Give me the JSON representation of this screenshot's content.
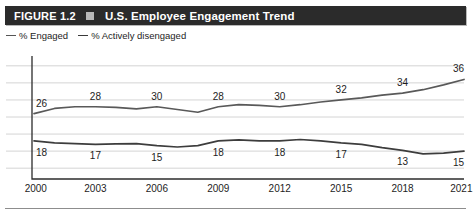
{
  "figure": {
    "number_label": "FIGURE 1.2",
    "bullet_icon": "square-bullet-icon",
    "title": "U.S. Employee Engagement Trend",
    "bar_color": "#2b2b2b",
    "bullet_color": "#b9b9b9"
  },
  "legend": {
    "position": "top-left",
    "items": [
      {
        "label": "% Engaged",
        "color": "#555555",
        "marker": "dash"
      },
      {
        "label": "% Actively disengaged",
        "color": "#3a3a3a",
        "marker": "dash"
      }
    ]
  },
  "source": {
    "text": ""
  },
  "chart_data": {
    "type": "line",
    "title": "U.S. Employee Engagement Trend",
    "xlabel": "",
    "ylabel": "",
    "grid": true,
    "gridlines_y": [
      10,
      15,
      20,
      25,
      30,
      35,
      40
    ],
    "ylim": [
      8,
      42
    ],
    "xlim": [
      2000,
      2021
    ],
    "tick_labels": [
      "2000",
      "2003",
      "2006",
      "2009",
      "2012",
      "2015",
      "2018",
      "2021"
    ],
    "ticks_x": [
      2000,
      2003,
      2006,
      2009,
      2012,
      2015,
      2018,
      2021
    ],
    "legend_position": "above-plot-left",
    "series": [
      {
        "name": "% Engaged",
        "color": "#595959",
        "x": [
          2000,
          2001,
          2002,
          2003,
          2004,
          2005,
          2006,
          2007,
          2008,
          2009,
          2010,
          2011,
          2012,
          2013,
          2014,
          2015,
          2016,
          2017,
          2018,
          2019,
          2020,
          2021
        ],
        "values": [
          26,
          27.5,
          28,
          28,
          27.8,
          27.4,
          28,
          27.2,
          26.4,
          28,
          28.6,
          28.4,
          28,
          28.6,
          29.4,
          30,
          30.6,
          31.4,
          32,
          33,
          34.4,
          36
        ],
        "labels": [
          {
            "x": 2000,
            "text": "26"
          },
          {
            "x": 2003,
            "text": "28"
          },
          {
            "x": 2006,
            "text": "30"
          },
          {
            "x": 2009,
            "text": "28"
          },
          {
            "x": 2012,
            "text": "30"
          },
          {
            "x": 2015,
            "text": "32"
          },
          {
            "x": 2018,
            "text": "34"
          },
          {
            "x": 2021,
            "text": "36"
          }
        ]
      },
      {
        "name": "% Actively disengaged",
        "color": "#3d3d3d",
        "x": [
          2000,
          2001,
          2002,
          2003,
          2004,
          2005,
          2006,
          2007,
          2008,
          2009,
          2010,
          2011,
          2012,
          2013,
          2014,
          2015,
          2016,
          2017,
          2018,
          2019,
          2020,
          2021
        ],
        "values": [
          18,
          17.4,
          17.2,
          17,
          17.1,
          17.2,
          16.6,
          16.2,
          16.6,
          18,
          18.3,
          18,
          18,
          18.4,
          18,
          17.4,
          17,
          16,
          15.2,
          14.2,
          14.4,
          15
        ],
        "labels": [
          {
            "x": 2000,
            "text": "18"
          },
          {
            "x": 2003,
            "text": "17"
          },
          {
            "x": 2006,
            "text": "15"
          },
          {
            "x": 2009,
            "text": "18"
          },
          {
            "x": 2012,
            "text": "18"
          },
          {
            "x": 2015,
            "text": "17"
          },
          {
            "x": 2018,
            "text": "13"
          },
          {
            "x": 2021,
            "text": "15"
          }
        ]
      }
    ]
  }
}
